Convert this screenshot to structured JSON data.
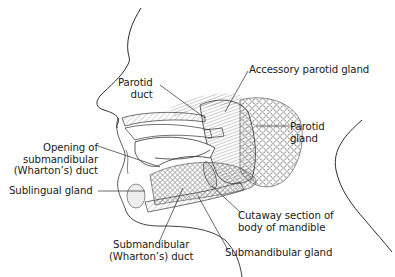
{
  "diagram": {
    "colors": {
      "line": "#2a2a2a",
      "background": "#ffffff"
    },
    "labels": {
      "parotid_duct": [
        "Parotid",
        "duct"
      ],
      "accessory_parotid_gland": "Accessory parotid gland",
      "parotid_gland": [
        "Parotid",
        "gland"
      ],
      "opening_submandibular_duct": [
        "Opening of",
        "submandibular",
        "(Wharton’s) duct"
      ],
      "sublingual_gland": "Sublingual gland",
      "cutaway_mandible": [
        "Cutaway section of",
        "body of mandible"
      ],
      "submandibular_duct": [
        "Submandibular",
        "(Wharton’s) duct"
      ],
      "submandibular_gland": "Submandibular gland"
    }
  }
}
